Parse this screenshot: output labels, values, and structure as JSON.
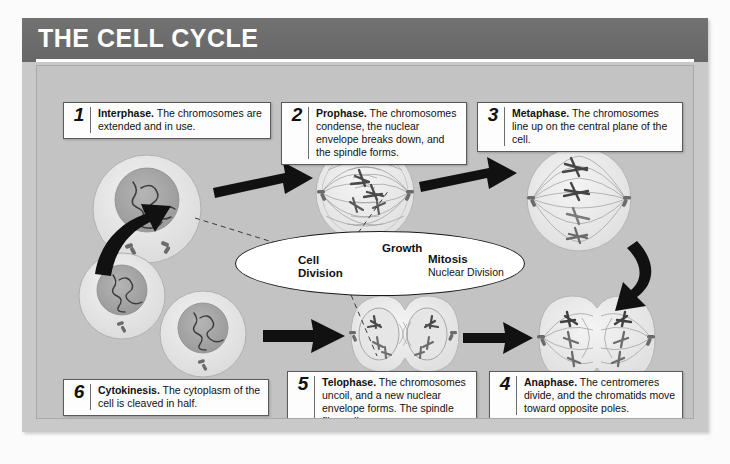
{
  "figure": {
    "title": "THE CELL CYCLE"
  },
  "colors": {
    "title_band": "#6c6c6c",
    "title_text": "#ffffff",
    "panel_background": "#c3c3c3",
    "caption_background": "#fdfdfd",
    "caption_border": "#5a5a5a",
    "arrow": "#111111",
    "ellipse_fill": "#ffffff",
    "ellipse_stroke": "#1b1b1b",
    "cytoplasm": "#e9e9e9",
    "nucleus": "#a8a8a8",
    "page_background": "#fbfbfb"
  },
  "captions": [
    {
      "number": "1",
      "term": "Interphase.",
      "text": "The chromosomes are extended and in use."
    },
    {
      "number": "2",
      "term": "Prophase.",
      "text": "The chromosomes condense, the nuclear envelope breaks down, and the spindle forms."
    },
    {
      "number": "3",
      "term": "Metaphase.",
      "text": "The chromosomes line up on the central plane of the cell."
    },
    {
      "number": "4",
      "term": "Anaphase.",
      "text": "The centromeres divide, and the chromatids move toward opposite poles."
    },
    {
      "number": "5",
      "term": "Telophase.",
      "text": "The chromosomes uncoil, and a new nuclear envelope forms. The spindle fibers disappear."
    },
    {
      "number": "6",
      "term": "Cytokinesis.",
      "text": "The cytoplasm of the cell is cleaved in half."
    }
  ],
  "center_ellipse": {
    "growth": "Growth",
    "cell_division_line1": "Cell",
    "cell_division_line2": "Division",
    "mitosis": "Mitosis",
    "nuclear_division": "Nuclear Division"
  },
  "cell_stages": [
    {
      "name": "interphase-cell",
      "stage": "Interphase",
      "description": "Round cell with intact nucleus containing extended chromatin and two centriole pairs"
    },
    {
      "name": "prophase-cell",
      "stage": "Prophase",
      "description": "Cell with condensed chromosomes, broken nuclear envelope and forming spindle fibers between two poles"
    },
    {
      "name": "metaphase-cell",
      "stage": "Metaphase",
      "description": "Cell with chromosomes aligned along the central equatorial plane attached to spindle fibers"
    },
    {
      "name": "anaphase-cell",
      "stage": "Anaphase",
      "description": "Elongating cell with sister chromatids pulled toward opposite poles"
    },
    {
      "name": "telophase-cell",
      "stage": "Telophase",
      "description": "Cell with a cleavage furrow and two reforming nuclei containing uncoiling chromosomes"
    },
    {
      "name": "cytokinesis-cells",
      "stage": "Cytokinesis",
      "description": "Two separated daughter cells each with its own nucleus and centrioles"
    }
  ],
  "arrows": [
    {
      "name": "arrow-interphase-to-prophase",
      "direction": "right",
      "shape": "straight"
    },
    {
      "name": "arrow-prophase-to-metaphase",
      "direction": "right",
      "shape": "straight"
    },
    {
      "name": "arrow-metaphase-to-anaphase",
      "direction": "down-left",
      "shape": "curved"
    },
    {
      "name": "arrow-anaphase-to-telophase",
      "direction": "left",
      "shape": "straight"
    },
    {
      "name": "arrow-telophase-to-cytokinesis",
      "direction": "left",
      "shape": "straight"
    },
    {
      "name": "arrow-cytokinesis-to-interphase",
      "direction": "up-right",
      "shape": "curved"
    }
  ]
}
